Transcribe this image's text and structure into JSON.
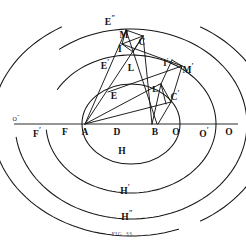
{
  "figure": {
    "caption": "FIG. 33.",
    "ink_color": "#151515",
    "caption_color": "#4a4a4a",
    "background_color": "#ffffff",
    "axis": {
      "name": "horizontal-axis",
      "y": 124,
      "x_start": 14,
      "x_end": 238
    },
    "axis_points": [
      {
        "id": "O-double-prime",
        "label": "O",
        "prime": "″",
        "x": 16,
        "y": 118,
        "size": "tiny"
      },
      {
        "id": "F-prime",
        "label": "F",
        "prime": "′",
        "x": 37,
        "y": 133,
        "size": "normal"
      },
      {
        "id": "F",
        "label": "F",
        "prime": "",
        "x": 65,
        "y": 133,
        "size": "normal"
      },
      {
        "id": "A",
        "label": "A",
        "prime": "",
        "x": 85,
        "y": 133,
        "size": "normal"
      },
      {
        "id": "D",
        "label": "D",
        "prime": "",
        "x": 117,
        "y": 133,
        "size": "normal"
      },
      {
        "id": "B",
        "label": "B",
        "prime": "",
        "x": 155,
        "y": 133,
        "size": "normal"
      },
      {
        "id": "O",
        "label": "O",
        "prime": "",
        "x": 176,
        "y": 133,
        "size": "normal"
      },
      {
        "id": "O-prime",
        "label": "O",
        "prime": "′",
        "x": 204,
        "y": 133,
        "size": "normal"
      },
      {
        "id": "O-outer",
        "label": "O",
        "prime": "",
        "x": 229,
        "y": 133,
        "size": "normal"
      }
    ],
    "construction_labels": [
      {
        "id": "E-double-prime",
        "label": "E",
        "prime": "″",
        "x": 110,
        "y": 21,
        "size": "normal"
      },
      {
        "id": "M",
        "label": "M",
        "prime": "",
        "x": 124,
        "y": 36,
        "size": "normal"
      },
      {
        "id": "C",
        "label": "C",
        "prime": "",
        "x": 142,
        "y": 43,
        "size": "normal"
      },
      {
        "id": "I",
        "label": "I",
        "prime": "",
        "x": 120,
        "y": 50,
        "size": "normal"
      },
      {
        "id": "E-prime",
        "label": "E",
        "prime": "′",
        "x": 105,
        "y": 65,
        "size": "normal"
      },
      {
        "id": "L",
        "label": "L",
        "prime": "",
        "x": 131,
        "y": 69,
        "size": "normal"
      },
      {
        "id": "I-prime",
        "label": "I",
        "prime": "′",
        "x": 166,
        "y": 62,
        "size": "sm"
      },
      {
        "id": "M-prime",
        "label": "M",
        "prime": "′",
        "x": 188,
        "y": 69,
        "size": "normal"
      },
      {
        "id": "L-prime",
        "label": "L",
        "prime": "′",
        "x": 156,
        "y": 88,
        "size": "sm"
      },
      {
        "id": "C-prime",
        "label": "C",
        "prime": "′",
        "x": 175,
        "y": 96,
        "size": "normal"
      },
      {
        "id": "E",
        "label": "E",
        "prime": "",
        "x": 114,
        "y": 97,
        "size": "normal"
      },
      {
        "id": "H",
        "label": "H",
        "prime": "",
        "x": 122,
        "y": 152,
        "size": "normal"
      },
      {
        "id": "H-prime",
        "label": "H",
        "prime": "′",
        "x": 125,
        "y": 190,
        "size": "normal"
      },
      {
        "id": "H-double-prime",
        "label": "H",
        "prime": "″",
        "x": 127,
        "y": 216,
        "size": "normal"
      }
    ],
    "curves": [
      {
        "id": "inner-circle",
        "cx": 131,
        "cy": 124,
        "rx": 49,
        "ry": 40,
        "start_deg": 0,
        "end_deg": 360
      },
      {
        "id": "middle-arc",
        "cx": 131,
        "cy": 124,
        "rx": 85,
        "ry": 69,
        "start_deg": -175,
        "end_deg": 150
      },
      {
        "id": "outer-arc",
        "cx": 131,
        "cy": 124,
        "rx": 116,
        "ry": 95,
        "start_deg": -172,
        "end_deg": 128
      },
      {
        "id": "outermost-arc-left",
        "cx": 131,
        "cy": 124,
        "rx": 139,
        "ry": 112,
        "start_deg": 120,
        "end_deg": 196
      },
      {
        "id": "outermost-arc-right",
        "cx": 131,
        "cy": 124,
        "rx": 139,
        "ry": 112,
        "start_deg": -60,
        "end_deg": 60
      },
      {
        "id": "outermost-arc-bottom",
        "cx": 131,
        "cy": 124,
        "rx": 139,
        "ry": 112,
        "start_deg": -196,
        "end_deg": -70
      }
    ],
    "segments": [
      {
        "id": "A-to-C",
        "x1": 85,
        "y1": 124,
        "x2": 143,
        "y2": 36
      },
      {
        "id": "A-to-M",
        "x1": 85,
        "y1": 124,
        "x2": 126,
        "y2": 30
      },
      {
        "id": "A-to-Lprime",
        "x1": 85,
        "y1": 124,
        "x2": 160,
        "y2": 84
      },
      {
        "id": "A-to-Cprime",
        "x1": 85,
        "y1": 124,
        "x2": 171,
        "y2": 102
      },
      {
        "id": "C-to-B",
        "x1": 143,
        "y1": 36,
        "x2": 152,
        "y2": 124
      },
      {
        "id": "M-to-B",
        "x1": 126,
        "y1": 30,
        "x2": 157,
        "y2": 124
      },
      {
        "id": "I-to-Mprime",
        "x1": 122,
        "y1": 44,
        "x2": 182,
        "y2": 66
      },
      {
        "id": "E-to-Mprime",
        "x1": 108,
        "y1": 92,
        "x2": 182,
        "y2": 66
      },
      {
        "id": "quad-M-I",
        "x1": 126,
        "y1": 30,
        "x2": 122,
        "y2": 44
      },
      {
        "id": "quad-I-C",
        "x1": 122,
        "y1": 44,
        "x2": 143,
        "y2": 36
      },
      {
        "id": "quad-M-C",
        "x1": 126,
        "y1": 30,
        "x2": 143,
        "y2": 36
      },
      {
        "id": "quad-I-low",
        "x1": 122,
        "y1": 44,
        "x2": 133,
        "y2": 52
      },
      {
        "id": "quad-C-low",
        "x1": 143,
        "y1": 36,
        "x2": 133,
        "y2": 52
      },
      {
        "id": "quadp-Ip-Mp",
        "x1": 172,
        "y1": 60,
        "x2": 182,
        "y2": 66
      },
      {
        "id": "quadp-Ip-Lp",
        "x1": 172,
        "y1": 60,
        "x2": 161,
        "y2": 84
      },
      {
        "id": "quadp-Mp-Cp",
        "x1": 182,
        "y1": 66,
        "x2": 171,
        "y2": 102
      },
      {
        "id": "quadp-Lp-Cp",
        "x1": 161,
        "y1": 84,
        "x2": 171,
        "y2": 102
      },
      {
        "id": "quadp-Lp-down",
        "x1": 161,
        "y1": 84,
        "x2": 166,
        "y2": 104
      },
      {
        "id": "Lp-to-B",
        "x1": 161,
        "y1": 84,
        "x2": 152,
        "y2": 124
      },
      {
        "id": "Cp-to-B",
        "x1": 171,
        "y1": 102,
        "x2": 158,
        "y2": 124
      }
    ]
  }
}
